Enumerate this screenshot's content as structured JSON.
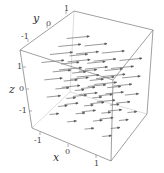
{
  "chart_data": {
    "type": "vector_field_3d",
    "title": "",
    "axes": {
      "x": {
        "label": "x",
        "ticks": [
          "-1",
          "0",
          "1"
        ],
        "range": [
          -1.5,
          1.5
        ]
      },
      "y": {
        "label": "y",
        "ticks": [
          "-1",
          "0",
          "1"
        ],
        "range": [
          -1.5,
          1.5
        ]
      },
      "z": {
        "label": "z",
        "ticks": [
          "-1",
          "0",
          "1"
        ],
        "range": [
          -1.5,
          1.5
        ]
      }
    },
    "box": true,
    "grid": false,
    "legend": null,
    "arrow_color": "#555555",
    "box_color": "#777777"
  },
  "labels": {
    "x_title": "x",
    "y_title": "y",
    "z_title": "z",
    "x_ticks": [
      "-1",
      "0",
      "1"
    ],
    "y_ticks": [
      "-1",
      "0",
      "1"
    ],
    "z_ticks": [
      "1",
      "0",
      "-1"
    ]
  }
}
